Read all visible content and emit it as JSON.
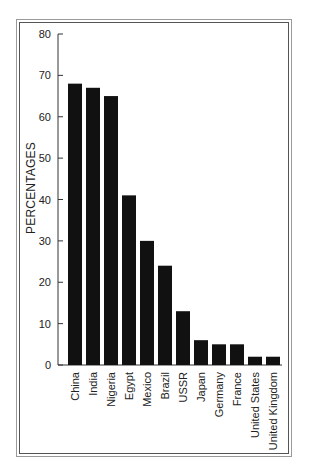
{
  "chart_data": {
    "type": "bar",
    "title": "",
    "xlabel": "",
    "ylabel": "PERCENTAGES",
    "ylim": [
      0,
      80
    ],
    "yticks": [
      0,
      10,
      20,
      30,
      40,
      50,
      60,
      70,
      80
    ],
    "grid": false,
    "legend": null,
    "bar_color": "#111111",
    "categories": [
      "China",
      "India",
      "Nigeria",
      "Egypt",
      "Mexico",
      "Brazil",
      "USSR",
      "Japan",
      "Germany",
      "France",
      "United States",
      "United Kingdom"
    ],
    "values": [
      68,
      67,
      65,
      41,
      30,
      24,
      13,
      6,
      5,
      5,
      2,
      2
    ]
  }
}
